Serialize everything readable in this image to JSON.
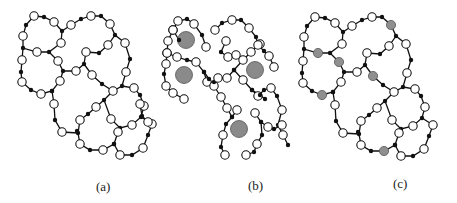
{
  "figure": {
    "panels": [
      {
        "id": "a",
        "label": "(a)",
        "description": "Network of white nodes and small black junction nodes forming closed rings"
      },
      {
        "id": "b",
        "label": "(b)",
        "description": "Fragmented network with open chains surrounding large grey particles"
      },
      {
        "id": "c",
        "label": "(c)",
        "description": "Same closed-ring network as (a) with selected nodes shaded grey"
      }
    ],
    "colors": {
      "edge": "#111111",
      "white_node_fill": "#ffffff",
      "white_node_stroke": "#111111",
      "black_node": "#111111",
      "grey_node": "#8f8f8f",
      "large_grey_particle": "#8a8a8a"
    },
    "node_radius": {
      "white": 4.2,
      "black": 2.2,
      "grey_small": 4.6,
      "grey_large": 8.5
    }
  },
  "network_a": {
    "nodes": [
      [
        34,
        16,
        "w"
      ],
      [
        44,
        17,
        "b"
      ],
      [
        54,
        22,
        "w"
      ],
      [
        62,
        31,
        "b"
      ],
      [
        61,
        43,
        "w"
      ],
      [
        49,
        52,
        "b"
      ],
      [
        37,
        52,
        "w"
      ],
      [
        23,
        48,
        "b"
      ],
      [
        23,
        36,
        "w"
      ],
      [
        26,
        25,
        "b"
      ],
      [
        22,
        60,
        "w"
      ],
      [
        21,
        72,
        "b"
      ],
      [
        22,
        82,
        "w"
      ],
      [
        31,
        90,
        "b"
      ],
      [
        41,
        94,
        "w"
      ],
      [
        52,
        91,
        "b"
      ],
      [
        60,
        81,
        "w"
      ],
      [
        63,
        71,
        "b"
      ],
      [
        58,
        61,
        "w"
      ],
      [
        71,
        25,
        "w"
      ],
      [
        81,
        19,
        "b"
      ],
      [
        91,
        16,
        "w"
      ],
      [
        101,
        16,
        "b"
      ],
      [
        110,
        24,
        "w"
      ],
      [
        115,
        35,
        "b"
      ],
      [
        125,
        43,
        "w"
      ],
      [
        130,
        59,
        "b"
      ],
      [
        126,
        72,
        "w"
      ],
      [
        122,
        86,
        "b"
      ],
      [
        113,
        91,
        "w"
      ],
      [
        102,
        84,
        "b"
      ],
      [
        92,
        75,
        "w"
      ],
      [
        84,
        64,
        "b"
      ],
      [
        76,
        71,
        "w"
      ],
      [
        86,
        52,
        "w"
      ],
      [
        99,
        53,
        "b"
      ],
      [
        108,
        45,
        "w"
      ],
      [
        134,
        88,
        "w"
      ],
      [
        140,
        95,
        "b"
      ],
      [
        144,
        106,
        "w"
      ],
      [
        141,
        117,
        "b"
      ],
      [
        132,
        125,
        "w"
      ],
      [
        120,
        128,
        "b"
      ],
      [
        111,
        119,
        "w"
      ],
      [
        104,
        100,
        "b"
      ],
      [
        96,
        107,
        "w"
      ],
      [
        88,
        114,
        "b"
      ],
      [
        80,
        120,
        "w"
      ],
      [
        78,
        133,
        "b"
      ],
      [
        80,
        144,
        "w"
      ],
      [
        90,
        150,
        "b"
      ],
      [
        103,
        150,
        "w"
      ],
      [
        114,
        144,
        "b"
      ],
      [
        118,
        132,
        "w"
      ],
      [
        77,
        131,
        "b"
      ],
      [
        62,
        132,
        "w"
      ],
      [
        55,
        120,
        "b"
      ],
      [
        54,
        104,
        "w"
      ],
      [
        52,
        91,
        "b"
      ],
      [
        152,
        124,
        "w"
      ],
      [
        148,
        135,
        "b"
      ],
      [
        143,
        148,
        "w"
      ],
      [
        132,
        155,
        "b"
      ],
      [
        120,
        155,
        "w"
      ],
      [
        114,
        144,
        "b"
      ]
    ],
    "edges_paths": [
      [
        [
          26,
          25
        ],
        [
          34,
          16
        ],
        [
          44,
          17
        ],
        [
          54,
          22
        ],
        [
          62,
          31
        ],
        [
          61,
          43
        ],
        [
          49,
          52
        ],
        [
          37,
          52
        ],
        [
          23,
          48
        ],
        [
          23,
          36
        ],
        [
          26,
          25
        ]
      ],
      [
        [
          23,
          48
        ],
        [
          22,
          60
        ],
        [
          21,
          72
        ],
        [
          22,
          82
        ],
        [
          31,
          90
        ],
        [
          41,
          94
        ],
        [
          52,
          91
        ],
        [
          60,
          81
        ],
        [
          63,
          71
        ],
        [
          58,
          61
        ],
        [
          49,
          52
        ]
      ],
      [
        [
          62,
          31
        ],
        [
          71,
          25
        ],
        [
          81,
          19
        ],
        [
          91,
          16
        ],
        [
          101,
          16
        ],
        [
          110,
          24
        ],
        [
          115,
          35
        ],
        [
          125,
          43
        ],
        [
          130,
          59
        ],
        [
          126,
          72
        ],
        [
          122,
          86
        ],
        [
          113,
          91
        ],
        [
          102,
          84
        ],
        [
          92,
          75
        ],
        [
          84,
          64
        ],
        [
          76,
          71
        ],
        [
          63,
          71
        ]
      ],
      [
        [
          84,
          64
        ],
        [
          86,
          52
        ],
        [
          99,
          53
        ],
        [
          108,
          45
        ],
        [
          115,
          35
        ]
      ],
      [
        [
          122,
          86
        ],
        [
          134,
          88
        ],
        [
          140,
          95
        ],
        [
          144,
          106
        ],
        [
          141,
          117
        ],
        [
          132,
          125
        ],
        [
          120,
          128
        ],
        [
          111,
          119
        ],
        [
          104,
          100
        ],
        [
          113,
          91
        ]
      ],
      [
        [
          104,
          100
        ],
        [
          96,
          107
        ],
        [
          88,
          114
        ],
        [
          80,
          120
        ],
        [
          78,
          133
        ],
        [
          80,
          144
        ],
        [
          90,
          150
        ],
        [
          103,
          150
        ],
        [
          114,
          144
        ],
        [
          118,
          132
        ],
        [
          120,
          128
        ]
      ],
      [
        [
          78,
          133
        ],
        [
          62,
          132
        ],
        [
          55,
          120
        ],
        [
          54,
          104
        ],
        [
          52,
          91
        ]
      ],
      [
        [
          141,
          117
        ],
        [
          152,
          124
        ],
        [
          148,
          135
        ],
        [
          143,
          148
        ],
        [
          132,
          155
        ],
        [
          120,
          155
        ],
        [
          114,
          144
        ]
      ]
    ]
  },
  "network_c": {
    "offset_x": 281,
    "offset_y": 1,
    "grey_nodes": [
      [
        37,
        52
      ],
      [
        58,
        61
      ],
      [
        92,
        75
      ],
      [
        110,
        24
      ],
      [
        133,
        93
      ],
      [
        103,
        150
      ],
      [
        43,
        92
      ]
    ]
  },
  "network_b": {
    "paths": [
      [
        [
          179,
          40
        ],
        [
          173,
          30
        ],
        [
          178,
          21
        ],
        [
          187,
          19
        ],
        [
          194,
          24
        ],
        [
          202,
          35
        ],
        [
          206,
          47
        ]
      ],
      [
        [
          173,
          30
        ],
        [
          168,
          41
        ],
        [
          167,
          53
        ],
        [
          177,
          57
        ],
        [
          187,
          60
        ],
        [
          196,
          62
        ],
        [
          204,
          72
        ],
        [
          207,
          82
        ]
      ],
      [
        [
          167,
          53
        ],
        [
          166,
          64
        ],
        [
          164,
          74
        ],
        [
          166,
          86
        ],
        [
          173,
          93
        ],
        [
          184,
          99
        ]
      ],
      [
        [
          204,
          72
        ],
        [
          209,
          79
        ],
        [
          214,
          86
        ],
        [
          221,
          97
        ],
        [
          227,
          108
        ],
        [
          232,
          117
        ],
        [
          237,
          110
        ]
      ],
      [
        [
          232,
          117
        ],
        [
          226,
          124
        ],
        [
          223,
          135
        ],
        [
          221,
          147
        ],
        [
          225,
          155
        ]
      ],
      [
        [
          214,
          82
        ],
        [
          218,
          78
        ],
        [
          227,
          78
        ],
        [
          234,
          70
        ],
        [
          243,
          60
        ],
        [
          251,
          52
        ],
        [
          260,
          44
        ]
      ],
      [
        [
          215,
          30
        ],
        [
          222,
          23
        ],
        [
          232,
          20
        ],
        [
          241,
          20
        ],
        [
          249,
          28
        ],
        [
          256,
          37
        ],
        [
          258,
          45
        ],
        [
          264,
          51
        ],
        [
          269,
          56
        ],
        [
          274,
          67
        ]
      ],
      [
        [
          226,
          41
        ],
        [
          221,
          52
        ],
        [
          228,
          57
        ],
        [
          236,
          55
        ]
      ],
      [
        [
          234,
          70
        ],
        [
          243,
          80
        ],
        [
          252,
          90
        ],
        [
          258,
          96
        ],
        [
          264,
          90
        ],
        [
          271,
          88
        ],
        [
          277,
          96
        ],
        [
          282,
          110
        ],
        [
          278,
          125
        ],
        [
          283,
          135
        ],
        [
          288,
          145
        ]
      ],
      [
        [
          252,
          90
        ],
        [
          260,
          95
        ],
        [
          265,
          99
        ]
      ],
      [
        [
          255,
          113
        ],
        [
          261,
          122
        ],
        [
          268,
          127
        ],
        [
          274,
          129
        ],
        [
          282,
          125
        ]
      ],
      [
        [
          261,
          122
        ],
        [
          262,
          135
        ],
        [
          257,
          144
        ],
        [
          254,
          152
        ],
        [
          246,
          155
        ]
      ],
      [
        [
          140,
          104
        ],
        [
          142,
          116
        ],
        [
          148,
          122
        ]
      ]
    ],
    "open_end_nodes_white": [
      [
        178,
        21
      ],
      [
        194,
        24
      ],
      [
        206,
        47
      ],
      [
        173,
        30
      ],
      [
        168,
        41
      ],
      [
        167,
        53
      ],
      [
        177,
        57
      ],
      [
        196,
        62
      ],
      [
        166,
        64
      ],
      [
        166,
        86
      ],
      [
        173,
        93
      ],
      [
        184,
        99
      ],
      [
        207,
        82
      ],
      [
        214,
        86
      ],
      [
        221,
        97
      ],
      [
        227,
        108
      ],
      [
        237,
        110
      ],
      [
        223,
        135
      ],
      [
        225,
        155
      ],
      [
        218,
        78
      ],
      [
        227,
        78
      ],
      [
        243,
        60
      ],
      [
        251,
        52
      ],
      [
        260,
        44
      ],
      [
        215,
        30
      ],
      [
        232,
        20
      ],
      [
        249,
        28
      ],
      [
        258,
        45
      ],
      [
        269,
        56
      ],
      [
        274,
        67
      ],
      [
        226,
        41
      ],
      [
        228,
        57
      ],
      [
        236,
        55
      ],
      [
        243,
        80
      ],
      [
        258,
        96
      ],
      [
        271,
        88
      ],
      [
        282,
        110
      ],
      [
        283,
        135
      ],
      [
        255,
        113
      ],
      [
        268,
        127
      ],
      [
        282,
        125
      ],
      [
        257,
        144
      ],
      [
        246,
        155
      ],
      [
        148,
        122
      ],
      [
        140,
        104
      ]
    ],
    "large_particles": [
      [
        186,
        40
      ],
      [
        184,
        75
      ],
      [
        255,
        70
      ],
      [
        239,
        129
      ]
    ]
  }
}
